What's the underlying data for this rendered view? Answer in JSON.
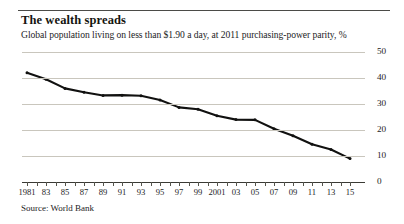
{
  "header": {
    "title": "The wealth spreads",
    "subtitle": "Global population living on less than $1.90 a day, at 2011 purchasing-power parity, %"
  },
  "footer": {
    "source": "Source: World Bank"
  },
  "axis": {
    "y_ticks": [
      "0",
      "10",
      "20",
      "30",
      "40",
      "50"
    ],
    "x_ticks": [
      "1981",
      "83",
      "85",
      "87",
      "89",
      "91",
      "93",
      "95",
      "97",
      "99",
      "2001",
      "03",
      "05",
      "07",
      "09",
      "11",
      "13",
      "15"
    ]
  },
  "style": {
    "line_color": "#111110",
    "grid_color": "#c9c6bd",
    "axis_color": "#3a3a34",
    "text_color": "#23231e",
    "background": "#ffffff"
  },
  "chart_data": {
    "type": "line",
    "title": "The wealth spreads",
    "subtitle": "Global population living on less than $1.90 a day, at 2011 purchasing-power parity, %",
    "xlabel": "",
    "ylabel": "%",
    "ylim": [
      0,
      50
    ],
    "xlim": [
      1981,
      2015
    ],
    "grid": true,
    "legend": false,
    "source": "Source: World Bank",
    "x": [
      1981,
      1983,
      1985,
      1987,
      1989,
      1991,
      1993,
      1995,
      1997,
      1999,
      2001,
      2003,
      2005,
      2007,
      2009,
      2011,
      2013,
      2015
    ],
    "values": [
      42.0,
      39.5,
      36.0,
      34.5,
      33.3,
      33.4,
      33.2,
      31.5,
      28.7,
      28.0,
      25.5,
      24.0,
      23.9,
      20.5,
      17.8,
      14.5,
      12.5,
      9.0
    ],
    "series": [
      {
        "name": "Share of global population below $1.90 a day",
        "values": [
          42.0,
          39.5,
          36.0,
          34.5,
          33.3,
          33.4,
          33.2,
          31.5,
          28.7,
          28.0,
          25.5,
          24.0,
          23.9,
          20.5,
          17.8,
          14.5,
          12.5,
          9.0
        ]
      }
    ]
  }
}
